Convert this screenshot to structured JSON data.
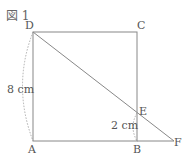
{
  "figure": {
    "title": "図 1",
    "points": {
      "A": "A",
      "B": "B",
      "C": "C",
      "D": "D",
      "E": "E",
      "F": "F"
    },
    "measurements": {
      "AD": "8 cm",
      "EB": "2 cm"
    }
  }
}
